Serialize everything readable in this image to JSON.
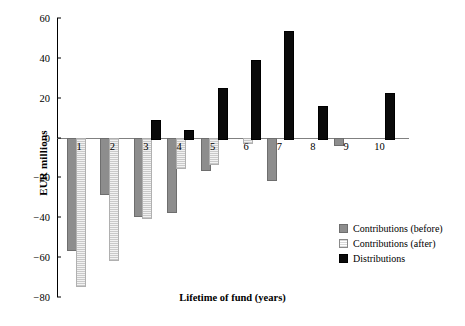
{
  "chart_data": {
    "type": "bar",
    "title": "",
    "xlabel": "Lifetime of fund (years)",
    "ylabel": "EUR millions",
    "categories": [
      "1",
      "2",
      "3",
      "4",
      "5",
      "6",
      "7",
      "8",
      "9",
      "10"
    ],
    "ylim": [
      -80,
      60
    ],
    "yticks": [
      60,
      40,
      20,
      0,
      -20,
      -40,
      -60,
      -80
    ],
    "ytick_labels": [
      "60",
      "40",
      "20",
      "0",
      "−20",
      "−40",
      "−60",
      "−80"
    ],
    "grid": false,
    "legend_position": "right",
    "series": [
      {
        "name": "Contributions (before)",
        "color": "#8d8d8d",
        "values": [
          -56,
          -28,
          -39,
          -37,
          -16,
          0,
          -21,
          0,
          -3,
          0
        ]
      },
      {
        "name": "Contributions (after)",
        "color": "#d8d8d8",
        "values": [
          -74,
          -61,
          -40,
          -15,
          -13,
          -2,
          0,
          0,
          0,
          0
        ]
      },
      {
        "name": "Distributions",
        "color": "#0a0a0a",
        "values": [
          0,
          0,
          9,
          4,
          25,
          39,
          53.5,
          16,
          0,
          22.5
        ]
      }
    ]
  },
  "legend": {
    "items": [
      {
        "label": "Contributions (before)",
        "swatch": "before"
      },
      {
        "label": "Contributions (after)",
        "swatch": "after"
      },
      {
        "label": "Distributions",
        "swatch": "dist"
      }
    ]
  }
}
